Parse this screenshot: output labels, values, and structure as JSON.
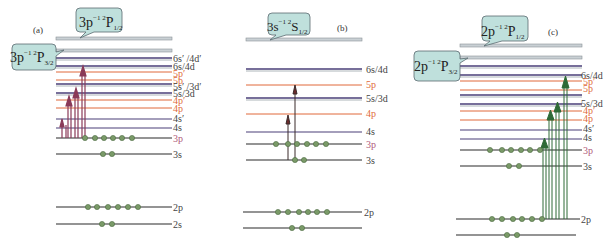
{
  "colors": {
    "core_level": "#2a2a2a",
    "s_d_level": "#4a3f78",
    "p_level": "#e0683a",
    "ion_level": "#9aa3a8",
    "ion_fill": "#c9d0d4",
    "bubble_fill": "#bfe0dc",
    "bubble_stroke": "#5a6a70",
    "electron": "#7a9a68",
    "arrow_a": "#8a3a58",
    "arrow_b": "#3a2a2a",
    "arrow_c": "#2e6a36",
    "label_gray": "#444444",
    "label_orange": "#e06a3a"
  },
  "panels": [
    {
      "id": "a",
      "label": "(a)",
      "bubbles": [
        {
          "text_main": "3p",
          "sup": "−1 2",
          "term": "P",
          "sub": "1/2",
          "name": "ion-limit-bubble-3p-P1/2"
        },
        {
          "text_main": "3p",
          "sup": "−1 2",
          "term": "P",
          "sub": "3/2",
          "name": "ion-limit-bubble-3p-P3/2"
        }
      ],
      "levels": [
        {
          "label": "6s′ /4d′",
          "type": "sd"
        },
        {
          "label": "6s/4d",
          "type": "sd"
        },
        {
          "label": "5p′",
          "type": "p"
        },
        {
          "label": "5p",
          "type": "p"
        },
        {
          "label": "5s′ /3d′",
          "type": "sd"
        },
        {
          "label": "5s/3d",
          "type": "sd"
        },
        {
          "label": "4p′",
          "type": "p"
        },
        {
          "label": "4p",
          "type": "p"
        },
        {
          "label": "4s′",
          "type": "sd"
        },
        {
          "label": "4s",
          "type": "sd"
        },
        {
          "label": "3p",
          "type": "core"
        },
        {
          "label": "3s",
          "type": "core"
        },
        {
          "label": "2p",
          "type": "core"
        },
        {
          "label": "2s",
          "type": "core"
        }
      ]
    },
    {
      "id": "b",
      "label": "(b)",
      "bubbles": [
        {
          "text_main": "3s",
          "sup": "−1 2",
          "term": "S",
          "sub": "1/2",
          "name": "ion-limit-bubble-3s-S1/2"
        }
      ],
      "levels": [
        {
          "label": "6s/4d",
          "type": "sd"
        },
        {
          "label": "5p",
          "type": "p"
        },
        {
          "label": "5s/3d",
          "type": "sd"
        },
        {
          "label": "4p",
          "type": "p"
        },
        {
          "label": "4s",
          "type": "sd"
        },
        {
          "label": "3p",
          "type": "core"
        },
        {
          "label": "3s",
          "type": "core"
        },
        {
          "label": "2p",
          "type": "core"
        },
        {
          "label": "",
          "type": "core"
        }
      ]
    },
    {
      "id": "c",
      "label": "(c)",
      "bubbles": [
        {
          "text_main": "2p",
          "sup": "−1 2",
          "term": "P",
          "sub": "1/2",
          "name": "ion-limit-bubble-2p-P1/2"
        },
        {
          "text_main": "2p",
          "sup": "−1 2",
          "term": "P",
          "sub": "3/2",
          "name": "ion-limit-bubble-2p-P3/2"
        }
      ],
      "levels": [
        {
          "label": "6s/4d",
          "type": "sd"
        },
        {
          "label": "5p′",
          "type": "p"
        },
        {
          "label": "5p",
          "type": "p"
        },
        {
          "label": "5s/3d",
          "type": "sd"
        },
        {
          "label": "4p′",
          "type": "p"
        },
        {
          "label": "4p",
          "type": "p"
        },
        {
          "label": "4s′",
          "type": "sd"
        },
        {
          "label": "4s",
          "type": "sd"
        },
        {
          "label": "3p",
          "type": "core"
        },
        {
          "label": "3s",
          "type": "core"
        },
        {
          "label": "2p",
          "type": "core"
        },
        {
          "label": "",
          "type": "core"
        }
      ]
    }
  ]
}
